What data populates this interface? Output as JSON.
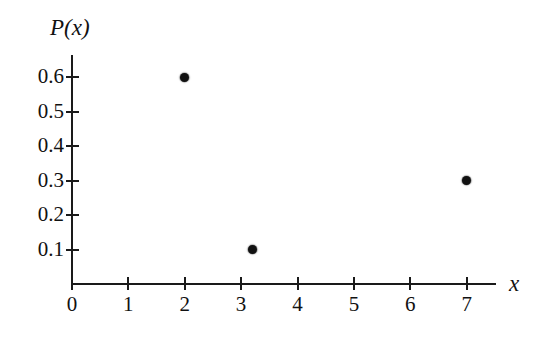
{
  "chart_data": {
    "type": "scatter",
    "title": "",
    "subtitle": "",
    "xlabel": "x",
    "ylabel": "P(x)",
    "xlim": [
      0,
      7.5
    ],
    "ylim": [
      0,
      0.65
    ],
    "grid": false,
    "legend": null,
    "x_ticks": [
      "0",
      "1",
      "2",
      "3",
      "4",
      "5",
      "6",
      "7"
    ],
    "x_tick_values": [
      0,
      1,
      2,
      3,
      4,
      5,
      6,
      7
    ],
    "y_ticks": [
      "0.1",
      "0.2",
      "0.3",
      "0.4",
      "0.5",
      "0.6"
    ],
    "y_tick_values": [
      0.1,
      0.2,
      0.3,
      0.4,
      0.5,
      0.6
    ],
    "points": [
      {
        "x": 2,
        "y": 0.6
      },
      {
        "x": 3.2,
        "y": 0.1
      },
      {
        "x": 7,
        "y": 0.3
      }
    ],
    "marker": "filled-circle",
    "marker_color": "#111111",
    "axis_color": "#1a1a1a",
    "background_color": "#ffffff"
  }
}
